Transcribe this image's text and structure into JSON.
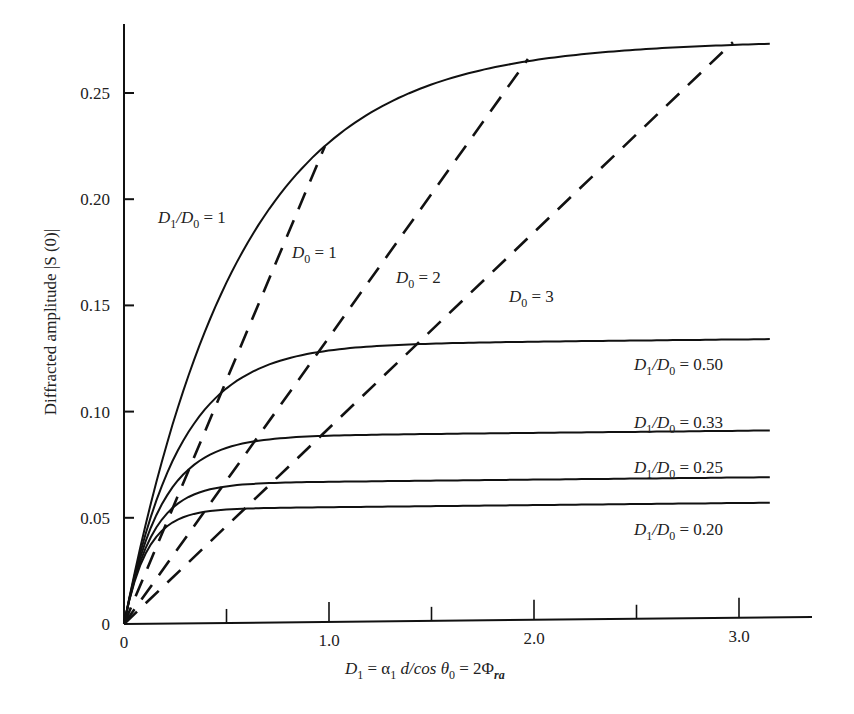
{
  "chart_data": {
    "type": "line",
    "title": "",
    "xlabel": "D1 = α1 d/cos θ0 = 2Φra",
    "ylabel": "Diffracted amplitude |S (0)|",
    "xlim": [
      0,
      3.35
    ],
    "ylim": [
      0,
      0.28
    ],
    "grid": false,
    "x_ticks": [
      0,
      0.5,
      1.0,
      1.5,
      2.0,
      2.5,
      3.0
    ],
    "x_tick_labels": [
      "0",
      "",
      "1.0",
      "",
      "2.0",
      "",
      "3.0"
    ],
    "y_ticks": [
      0,
      0.05,
      0.1,
      0.15,
      0.2,
      0.25
    ],
    "y_tick_labels": [
      "0",
      "0.05",
      "0.10",
      "0.15",
      "0.20",
      "0.25"
    ],
    "series": [
      {
        "name": "D1/D0 = 1",
        "style": "solid",
        "x": [
          0,
          0.25,
          0.5,
          0.75,
          1.0,
          1.5,
          2.0,
          2.5,
          3.0,
          3.15
        ],
        "values": [
          0,
          0.098,
          0.16,
          0.199,
          0.225,
          0.253,
          0.264,
          0.269,
          0.27,
          0.271
        ]
      },
      {
        "name": "D1/D0 = 0.50",
        "style": "solid",
        "x": [
          0,
          0.25,
          0.5,
          0.75,
          1.0,
          1.5,
          2.0,
          3.0,
          3.15
        ],
        "values": [
          0,
          0.079,
          0.11,
          0.123,
          0.128,
          0.13,
          0.131,
          0.131,
          0.131
        ]
      },
      {
        "name": "D1/D0 = 0.33",
        "style": "solid",
        "x": [
          0,
          0.25,
          0.5,
          0.75,
          1.0,
          2.0,
          3.15
        ],
        "values": [
          0,
          0.067,
          0.082,
          0.086,
          0.087,
          0.088,
          0.088
        ]
      },
      {
        "name": "D1/D0 = 0.25",
        "style": "solid",
        "x": [
          0,
          0.25,
          0.5,
          0.75,
          1.0,
          2.0,
          3.15
        ],
        "values": [
          0,
          0.056,
          0.064,
          0.065,
          0.066,
          0.066,
          0.066
        ]
      },
      {
        "name": "D1/D0 = 0.20",
        "style": "solid",
        "x": [
          0,
          0.25,
          0.5,
          0.75,
          1.0,
          2.0,
          3.15
        ],
        "values": [
          0,
          0.048,
          0.053,
          0.054,
          0.054,
          0.054,
          0.054
        ]
      },
      {
        "name": "D0 = 1",
        "style": "dashed",
        "x": [
          0,
          0.98
        ],
        "values": [
          0,
          0.224
        ]
      },
      {
        "name": "D0 = 2",
        "style": "dashed",
        "x": [
          0,
          1.97
        ],
        "values": [
          0,
          0.264
        ]
      },
      {
        "name": "D0 = 3",
        "style": "dashed",
        "x": [
          0,
          2.97
        ],
        "values": [
          0,
          0.271
        ]
      }
    ],
    "annotations": [
      {
        "text": "D1/D0 = 1",
        "x": 0.17,
        "y": 0.198
      },
      {
        "text": "D0 = 1",
        "x": 0.82,
        "y": 0.172
      },
      {
        "text": "D0 = 2",
        "x": 1.33,
        "y": 0.159
      },
      {
        "text": "D0 = 3",
        "x": 1.88,
        "y": 0.149
      },
      {
        "text": "D1/D0 = 0.50",
        "x": 2.48,
        "y": 0.119
      },
      {
        "text": "D1/D0 = 0.33",
        "x": 2.48,
        "y": 0.092
      },
      {
        "text": "D1/D0 = 0.25",
        "x": 2.48,
        "y": 0.07
      },
      {
        "text": "D1/D0 = 0.20",
        "x": 2.48,
        "y": 0.041
      }
    ]
  },
  "labels": {
    "y_axis_title": "Diffracted amplitude |S (0)|",
    "x_axis_title_parts": {
      "d1": "D",
      "d1_sub": "1",
      "eq1": " = α",
      "a_sub": "1",
      "mid": " d/cos θ",
      "th_sub": "0",
      "eq2": " = 2Φ",
      "phi_sub": "ra"
    },
    "curve_labels": [
      {
        "main": "D",
        "sub1": "1",
        "slash": "/D",
        "sub0": "0",
        "value": " = 1"
      },
      {
        "main": "D",
        "sub1": "1",
        "slash": "/D",
        "sub0": "0",
        "value": " = 0.50"
      },
      {
        "main": "D",
        "sub1": "1",
        "slash": "/D",
        "sub0": "0",
        "value": " = 0.33"
      },
      {
        "main": "D",
        "sub1": "1",
        "slash": "/D",
        "sub0": "0",
        "value": " = 0.25"
      },
      {
        "main": "D",
        "sub1": "1",
        "slash": "/D",
        "sub0": "0",
        "value": " = 0.20"
      }
    ],
    "dash_labels": [
      {
        "main": "D",
        "sub0": "0",
        "value": " = 1"
      },
      {
        "main": "D",
        "sub0": "0",
        "value": " = 2"
      },
      {
        "main": "D",
        "sub0": "0",
        "value": " = 3"
      }
    ]
  }
}
